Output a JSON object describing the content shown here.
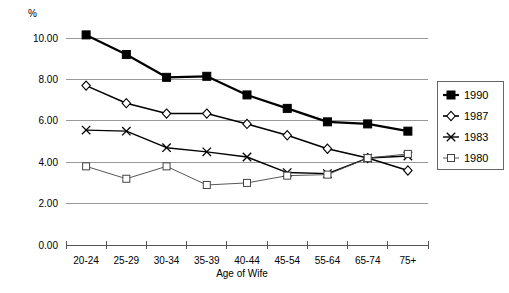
{
  "chart_data": {
    "type": "line",
    "title": "",
    "xlabel": "Age of Wife",
    "ylabel": "%",
    "ylim": [
      0.0,
      10.0
    ],
    "ytick_labels": [
      "10.00",
      "8.00",
      "6.00",
      "4.00",
      "2.00",
      "0.00"
    ],
    "ytick_values": [
      10.0,
      8.0,
      6.0,
      4.0,
      2.0,
      0.0
    ],
    "grid": true,
    "legend_position": "right",
    "categories": [
      "20-24",
      "25-29",
      "30-34",
      "35-39",
      "40-44",
      "45-54",
      "55-64",
      "65-74",
      "75+"
    ],
    "series": [
      {
        "name": "1990",
        "marker": "filled-square",
        "color": "#000000",
        "line_width": 2.2,
        "values": [
          10.15,
          9.2,
          8.1,
          8.15,
          7.25,
          6.6,
          5.95,
          5.85,
          5.5
        ]
      },
      {
        "name": "1987",
        "marker": "open-diamond",
        "color": "#000000",
        "line_width": 1.6,
        "values": [
          7.7,
          6.85,
          6.35,
          6.35,
          5.85,
          5.3,
          4.65,
          4.2,
          3.6
        ]
      },
      {
        "name": "1983",
        "marker": "cross-x",
        "color": "#000000",
        "line_width": 1.4,
        "values": [
          5.55,
          5.5,
          4.7,
          4.5,
          4.25,
          3.5,
          3.45,
          4.2,
          4.3
        ]
      },
      {
        "name": "1980",
        "marker": "open-square",
        "color": "#444444",
        "line_width": 0.9,
        "values": [
          3.8,
          3.2,
          3.8,
          2.9,
          3.0,
          3.35,
          3.4,
          4.2,
          4.4
        ]
      }
    ]
  },
  "legend": {
    "entries": [
      {
        "label": "1990"
      },
      {
        "label": "1987"
      },
      {
        "label": "1983"
      },
      {
        "label": "1980"
      }
    ]
  },
  "axes": {
    "y_unit": "%",
    "x_title": "Age of Wife"
  }
}
